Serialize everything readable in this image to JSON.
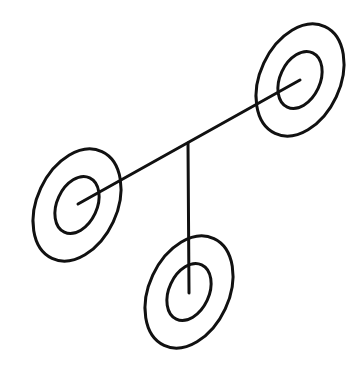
{
  "diagram": {
    "type": "molecule-like line drawing",
    "stroke_color": "#111111",
    "background": "#ffffff",
    "nodes": [
      {
        "id": "top-right",
        "cx": 300,
        "cy": 80,
        "outer": {
          "rx": 40,
          "ry": 59
        },
        "inner": {
          "rx": 20,
          "ry": 30
        },
        "rotate": 25
      },
      {
        "id": "left",
        "cx": 77,
        "cy": 205,
        "outer": {
          "rx": 40,
          "ry": 59
        },
        "inner": {
          "rx": 20,
          "ry": 30
        },
        "rotate": 25
      },
      {
        "id": "bottom",
        "cx": 189,
        "cy": 292,
        "outer": {
          "rx": 40,
          "ry": 59
        },
        "inner": {
          "rx": 20,
          "ry": 30
        },
        "rotate": 25
      }
    ],
    "edges": [
      {
        "from": [
          78,
          204
        ],
        "to": [
          300,
          80
        ]
      },
      {
        "from": [
          188,
          143
        ],
        "to": [
          189,
          293
        ]
      }
    ]
  }
}
